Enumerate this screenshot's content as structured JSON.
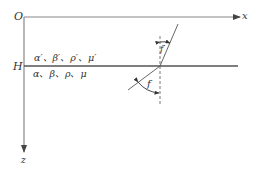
{
  "diagram": {
    "axes": {
      "origin_label": "O",
      "x_label": "x",
      "z_label": "z"
    },
    "interface": {
      "depth_label": "H",
      "upper_medium_params": "α′、β′、ρ′、μ′",
      "lower_medium_params": "α、β、ρ、μ"
    },
    "angles": {
      "upper_angle_label": "f′",
      "lower_angle_label": "f"
    },
    "colors": {
      "line": "#555555",
      "axis": "#777777",
      "text": "#333333",
      "background": "#ffffff"
    }
  }
}
